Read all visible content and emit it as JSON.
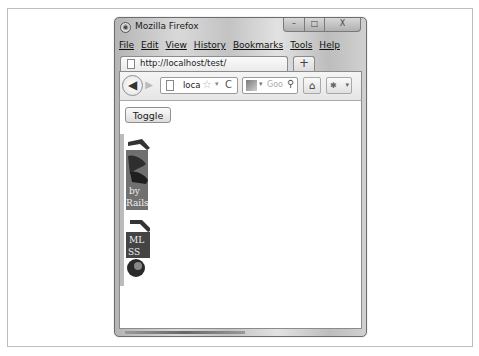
{
  "window": {
    "title": "Mozilla Firefox",
    "controls": {
      "minimize": "–",
      "maximize": "□",
      "close": "X"
    }
  },
  "menubar": {
    "items": [
      "File",
      "Edit",
      "View",
      "History",
      "Bookmarks",
      "Tools",
      "Help"
    ]
  },
  "tabs": [
    {
      "label": "http://localhost/test/",
      "icon": "blank-page-icon"
    }
  ],
  "newtab": {
    "label": "+"
  },
  "navbar": {
    "back": "◀",
    "forward": "▶",
    "url": "loca",
    "bookmark_star": "☆",
    "url_dropdown": "▾",
    "reload": "C",
    "search_dropdown": "▾",
    "search_placeholder": "Goo",
    "search_icon": "⚲",
    "home": "⌂",
    "addon_dropdown": "▾"
  },
  "content": {
    "toggle_label": "Toggle",
    "book1": {
      "text_line1": "by",
      "text_line2": "Rails"
    },
    "book2": {
      "text_line1": "ML",
      "text_line2": "SS"
    }
  },
  "colors": {
    "window_frame": "#c8c8c8",
    "book_dark": "#3a3a3a",
    "book_mid": "#6a6a6a"
  }
}
